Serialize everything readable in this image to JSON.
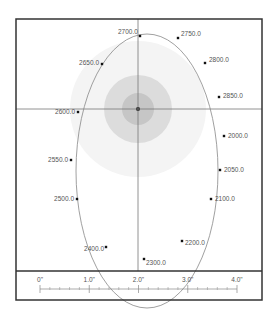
{
  "diagram": {
    "type": "orbit-plot",
    "frame": {
      "x": 16,
      "y": 19,
      "w": 246,
      "h": 281,
      "divider_y": 271
    },
    "crosshair": {
      "x": 138,
      "y": 109
    },
    "center_disc": {
      "cx": 138,
      "cy": 109,
      "rings": [
        {
          "r": 68,
          "color": "#f4f4f4"
        },
        {
          "r": 34,
          "color": "#dcdcdc"
        },
        {
          "r": 16,
          "color": "#c6c6c6"
        },
        {
          "r": 2,
          "color": "#111111"
        }
      ]
    },
    "ellipse": {
      "cx": 147,
      "cy": 171,
      "rx": 71,
      "ry": 137,
      "stroke": "#888888"
    },
    "points": [
      {
        "label": "2700.0",
        "x": 140,
        "y": 36,
        "lx": 118,
        "ly": 34,
        "anchor": "start"
      },
      {
        "label": "2750.0",
        "x": 178,
        "y": 38,
        "lx": 181,
        "ly": 36,
        "anchor": "start"
      },
      {
        "label": "2800.0",
        "x": 205,
        "y": 63,
        "lx": 209,
        "ly": 62,
        "anchor": "start"
      },
      {
        "label": "2850.0",
        "x": 219,
        "y": 97,
        "lx": 223,
        "ly": 98,
        "anchor": "start"
      },
      {
        "label": "2000.0",
        "x": 224,
        "y": 136,
        "lx": 228,
        "ly": 138,
        "anchor": "start"
      },
      {
        "label": "2050.0",
        "x": 220,
        "y": 170,
        "lx": 224,
        "ly": 172,
        "anchor": "start"
      },
      {
        "label": "2100.0",
        "x": 211,
        "y": 199,
        "lx": 215,
        "ly": 201,
        "anchor": "start"
      },
      {
        "label": "2200.0",
        "x": 182,
        "y": 241,
        "lx": 185,
        "ly": 245,
        "anchor": "start"
      },
      {
        "label": "2300.0",
        "x": 144,
        "y": 259,
        "lx": 146,
        "ly": 265,
        "anchor": "start"
      },
      {
        "label": "2400.0",
        "x": 106,
        "y": 247,
        "lx": 104,
        "ly": 251,
        "anchor": "end"
      },
      {
        "label": "2500.0",
        "x": 77,
        "y": 199,
        "lx": 74,
        "ly": 201,
        "anchor": "end"
      },
      {
        "label": "2550.0",
        "x": 71,
        "y": 160,
        "lx": 68,
        "ly": 162,
        "anchor": "end"
      },
      {
        "label": "2600.0",
        "x": 78,
        "y": 112,
        "lx": 75,
        "ly": 114,
        "anchor": "end"
      },
      {
        "label": "2650.0",
        "x": 102,
        "y": 64,
        "lx": 99,
        "ly": 65,
        "anchor": "end"
      }
    ],
    "scale_bar": {
      "x0": 40,
      "x1": 237,
      "y": 289,
      "labels": [
        "0\"",
        "1.0\"",
        "2.0\"",
        "3.0\"",
        "4.0\""
      ],
      "minor_per_major": 4
    }
  }
}
